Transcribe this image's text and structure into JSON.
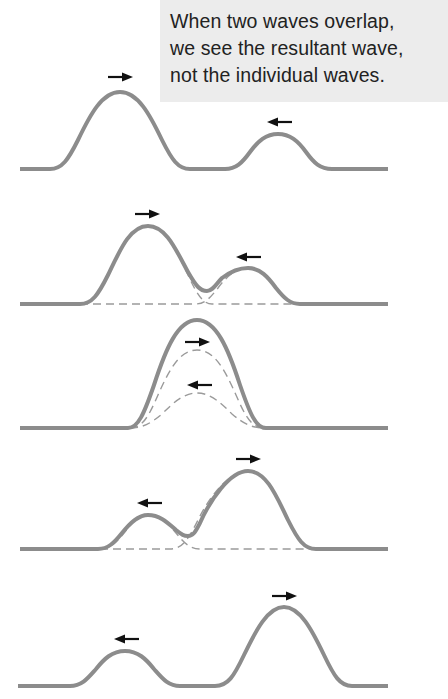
{
  "caption": {
    "lines": [
      "When two waves overlap,",
      "we see the resultant wave,",
      "not the individual waves."
    ],
    "background": "#ececec"
  },
  "colors": {
    "wave": "#8c8c8c",
    "component_wave_dashed": "#9a9a9a",
    "arrow": "#111111"
  },
  "panels": [
    {
      "index": 1,
      "description": "Two separate pulses approaching each other",
      "pulses": [
        {
          "role": "large pulse",
          "direction": "right",
          "peak_x": 120
        },
        {
          "role": "small pulse",
          "direction": "left",
          "peak_x": 278
        }
      ],
      "shows_components": false
    },
    {
      "index": 2,
      "description": "Pulses begin to overlap; resultant shown solid, components dashed",
      "pulses": [
        {
          "role": "large pulse",
          "direction": "right",
          "peak_x": 148
        },
        {
          "role": "small pulse",
          "direction": "left",
          "peak_x": 248
        }
      ],
      "shows_components": true
    },
    {
      "index": 3,
      "description": "Complete overlap; resultant amplitude equals sum of both",
      "pulses": [
        {
          "role": "large pulse",
          "direction": "right",
          "peak_x": 197
        },
        {
          "role": "small pulse",
          "direction": "left",
          "peak_x": 197
        }
      ],
      "shows_components": true
    },
    {
      "index": 4,
      "description": "Pulses separating after overlap",
      "pulses": [
        {
          "role": "small pulse",
          "direction": "left",
          "peak_x": 148
        },
        {
          "role": "large pulse",
          "direction": "right",
          "peak_x": 248
        }
      ],
      "shows_components": true
    },
    {
      "index": 5,
      "description": "Pulses fully separated, continuing unchanged",
      "pulses": [
        {
          "role": "small pulse",
          "direction": "left",
          "peak_x": 125
        },
        {
          "role": "large pulse",
          "direction": "right",
          "peak_x": 284
        }
      ],
      "shows_components": false
    }
  ],
  "icons": {
    "right_arrow": "arrow-right-icon",
    "left_arrow": "arrow-left-icon"
  }
}
